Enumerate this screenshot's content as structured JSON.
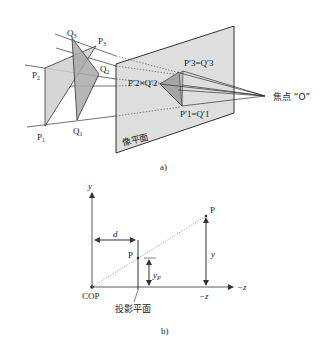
{
  "figure_a": {
    "caption": "a)",
    "image_plane_label": "像平面",
    "focal_point_label": "焦点 “O”",
    "points": {
      "P1": "P1",
      "P2": "P2",
      "P3": "P3",
      "Q1": "Q1",
      "Q2": "Q2",
      "Q3": "Q3"
    },
    "point_labels": {
      "P1": {
        "main": "P",
        "sub": "1"
      },
      "P2": {
        "main": "P",
        "sub": "2"
      },
      "P3": {
        "main": "P",
        "sub": "3"
      },
      "Q1": {
        "main": "Q",
        "sub": "1"
      },
      "Q2": {
        "main": "Q",
        "sub": "2"
      },
      "Q3": {
        "main": "Q",
        "sub": "3"
      }
    },
    "projected_labels": {
      "p3q3": "P′3=Q′3",
      "p2q2": "P′2=Q′2",
      "p1q1": "P′1=Q′1"
    },
    "colors": {
      "plane_fill": "#dcdcdc",
      "triangle_p_fill": "#c8c8c8",
      "triangle_q_fill": "#a8a8a8",
      "line": "#333333"
    }
  },
  "figure_b": {
    "caption": "b)",
    "y_axis_label": "y",
    "z_axis_label": "−z",
    "z_tick_label": "−z",
    "origin_label": "COP",
    "projection_plane_label": "投影平面",
    "distance_label": "d",
    "point_p_label": "P",
    "projected_point_label": "P",
    "y_label": "y",
    "yp_label": {
      "main": "y",
      "sub": "P"
    }
  }
}
